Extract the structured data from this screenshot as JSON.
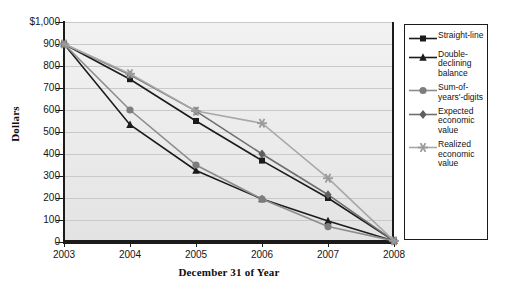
{
  "chart_data": {
    "type": "line",
    "title": "",
    "xlabel": "December 31 of Year",
    "ylabel": "Dollars",
    "categories": [
      "2003",
      "2004",
      "2005",
      "2006",
      "2007",
      "2008"
    ],
    "x_tick_labels": [
      "2003",
      "2004",
      "2005",
      "2006",
      "2007",
      "2008"
    ],
    "y_tick_labels": [
      "$1,000",
      "900",
      "800",
      "700",
      "600",
      "500",
      "400",
      "300",
      "200",
      "100",
      "0"
    ],
    "y_tick_values": [
      1000,
      900,
      800,
      700,
      600,
      500,
      400,
      300,
      200,
      100,
      0
    ],
    "ylim": [
      0,
      1000
    ],
    "grid": true,
    "legend_position": "right",
    "series": [
      {
        "name": "Straight-line",
        "marker": "square",
        "color": "#1b1b1b",
        "marker_color": "#1b1b1b",
        "values": [
          900,
          740,
          550,
          370,
          200,
          5
        ]
      },
      {
        "name": "Double-declining balance",
        "marker": "triangle",
        "color": "#1b1b1b",
        "marker_color": "#1b1b1b",
        "values": [
          900,
          533,
          325,
          195,
          95,
          5
        ]
      },
      {
        "name": "Sum-of-years'-digits",
        "marker": "circle",
        "color": "#8c8c8c",
        "marker_color": "#7d7d7d",
        "values": [
          900,
          600,
          350,
          195,
          70,
          5
        ]
      },
      {
        "name": "Expected economic value",
        "marker": "diamond",
        "color": "#6e6e6e",
        "marker_color": "#5e5e5e",
        "values": [
          900,
          760,
          595,
          400,
          215,
          5
        ]
      },
      {
        "name": "Realized economic value",
        "marker": "asterisk",
        "color": "#a8a8a8",
        "marker_color": "#9a9a9a",
        "values": [
          900,
          765,
          595,
          540,
          290,
          5
        ]
      }
    ]
  },
  "legend": {
    "items": [
      {
        "label": "Straight-line"
      },
      {
        "label": "Double-declining balance"
      },
      {
        "label": "Sum-of-years'-digits"
      },
      {
        "label": "Expected economic value"
      },
      {
        "label": "Realized economic value"
      }
    ]
  }
}
